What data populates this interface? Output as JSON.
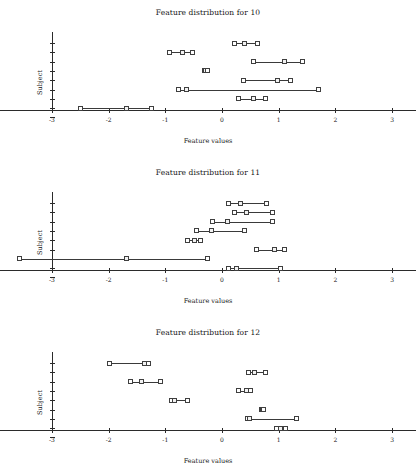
{
  "figure": {
    "xlabel": "Feature values",
    "ylabel": "Subject",
    "x_ticks": [
      "-3",
      "-2",
      "-1",
      "0",
      "1",
      "2",
      "3"
    ],
    "xlim": [
      -3,
      3
    ],
    "n_subjects": 8
  },
  "chart_data": [
    {
      "type": "scatter",
      "title": "Feature distribution for 10",
      "xlabel": "Feature values",
      "ylabel": "Subject",
      "xlim": [
        -3,
        3
      ],
      "ylim": [
        0,
        9
      ],
      "grid": false,
      "legend": null,
      "xticks": [
        -3,
        -2,
        -1,
        0,
        1,
        2,
        3
      ],
      "series": [
        {
          "name": "subject-1",
          "min": 0.22,
          "median": 0.4,
          "max": 0.62
        },
        {
          "name": "subject-2",
          "min": -0.92,
          "median": -0.7,
          "max": -0.52
        },
        {
          "name": "subject-3",
          "min": 0.55,
          "median": 1.11,
          "max": 1.42
        },
        {
          "name": "subject-4",
          "min": -0.31,
          "median": -0.29,
          "max": -0.26
        },
        {
          "name": "subject-5",
          "min": 0.38,
          "median": 0.98,
          "max": 1.2
        },
        {
          "name": "subject-6",
          "min": -0.76,
          "median": -0.63,
          "max": 1.71
        },
        {
          "name": "subject-7",
          "min": 0.29,
          "median": 0.56,
          "max": 0.77
        },
        {
          "name": "subject-8",
          "min": -2.49,
          "median": -1.69,
          "max": -1.25
        }
      ]
    },
    {
      "type": "scatter",
      "title": "Feature distribution for 11",
      "xlabel": "Feature values",
      "ylabel": "Subject",
      "xlim": [
        -3,
        3
      ],
      "ylim": [
        0,
        9
      ],
      "grid": false,
      "legend": null,
      "xticks": [
        -3,
        -2,
        -1,
        0,
        1,
        2,
        3
      ],
      "series": [
        {
          "name": "subject-1",
          "min": 0.11,
          "median": 0.33,
          "max": 0.78
        },
        {
          "name": "subject-2",
          "min": 0.22,
          "median": 0.44,
          "max": 0.89
        },
        {
          "name": "subject-3",
          "min": -0.17,
          "median": 0.09,
          "max": 0.89
        },
        {
          "name": "subject-4",
          "min": -0.45,
          "median": -0.18,
          "max": 0.39
        },
        {
          "name": "subject-5",
          "min": -0.61,
          "median": -0.48,
          "max": -0.38
        },
        {
          "name": "subject-6",
          "min": 0.6,
          "median": 0.93,
          "max": 1.11
        },
        {
          "name": "subject-7",
          "min": -3.58,
          "median": -1.69,
          "max": -0.26
        },
        {
          "name": "subject-8",
          "min": 0.11,
          "median": 0.26,
          "max": 1.04
        }
      ]
    },
    {
      "type": "scatter",
      "title": "Feature distribution for 12",
      "xlabel": "Feature values",
      "ylabel": "Subject",
      "xlim": [
        -3,
        3
      ],
      "ylim": [
        0,
        9
      ],
      "grid": false,
      "legend": null,
      "xticks": [
        -3,
        -2,
        -1,
        0,
        1,
        2,
        3
      ],
      "series": [
        {
          "name": "subject-1",
          "min": -1.98,
          "median": -1.36,
          "max": -1.29
        },
        {
          "name": "subject-2",
          "min": 0.46,
          "median": 0.58,
          "max": 0.76
        },
        {
          "name": "subject-3",
          "min": -1.62,
          "median": -1.42,
          "max": -1.09
        },
        {
          "name": "subject-4",
          "min": 0.29,
          "median": 0.43,
          "max": 0.5
        },
        {
          "name": "subject-5",
          "min": -0.89,
          "median": -0.84,
          "max": -0.6
        },
        {
          "name": "subject-6",
          "min": 0.69,
          "median": 0.71,
          "max": 0.74
        },
        {
          "name": "subject-7",
          "min": 0.45,
          "median": 0.49,
          "max": 1.31
        },
        {
          "name": "subject-8",
          "min": 0.96,
          "median": 1.03,
          "max": 1.12
        }
      ]
    }
  ]
}
